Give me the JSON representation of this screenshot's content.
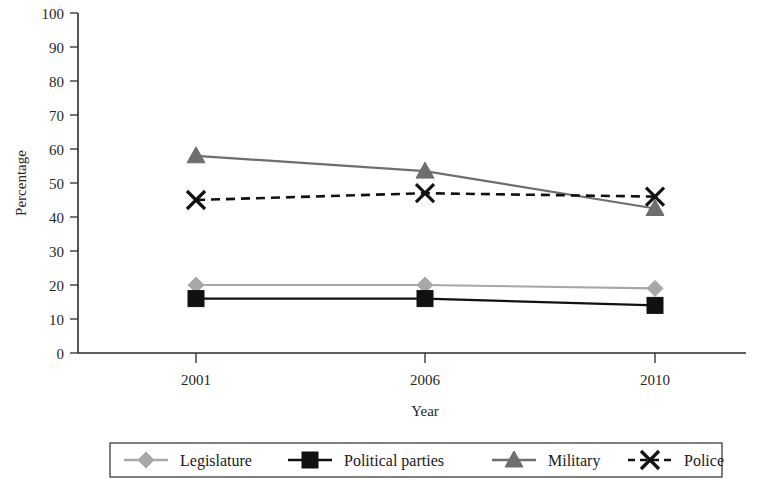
{
  "chart_data": {
    "type": "line",
    "title": "",
    "xlabel": "Year",
    "ylabel": "Percentage",
    "categories": [
      "2001",
      "2006",
      "2010"
    ],
    "ylim": [
      0,
      100
    ],
    "yticks": [
      "0",
      "10",
      "20",
      "30",
      "40",
      "50",
      "60",
      "70",
      "80",
      "90",
      "100"
    ],
    "grid": false,
    "legend_position": "bottom",
    "series": [
      {
        "name": "Legislature",
        "values": [
          20,
          20,
          19
        ],
        "marker": "diamond",
        "color": "#a8a8a8",
        "line_style": "solid"
      },
      {
        "name": "Political parties",
        "values": [
          16,
          16,
          14
        ],
        "marker": "square",
        "color": "#111111",
        "line_style": "solid"
      },
      {
        "name": "Military",
        "values": [
          58,
          53.5,
          42.5
        ],
        "marker": "triangle",
        "color": "#6e6e6e",
        "line_style": "solid"
      },
      {
        "name": "Police",
        "values": [
          45,
          47,
          46
        ],
        "marker": "cross-x",
        "color": "#111111",
        "line_style": "dashed"
      }
    ]
  }
}
